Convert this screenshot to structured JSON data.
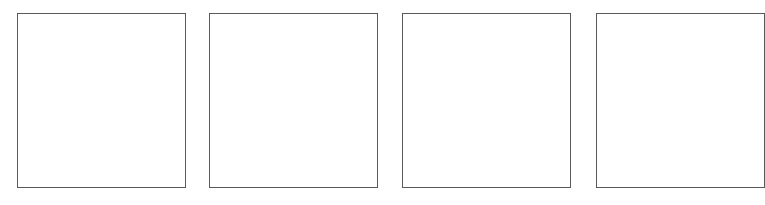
{
  "panels": [
    {
      "label": ""
    },
    {
      "label": ""
    },
    {
      "label": ""
    },
    {
      "label": ""
    }
  ],
  "colors": {
    "background": "#ffffff",
    "border": "#5a5a5a"
  }
}
